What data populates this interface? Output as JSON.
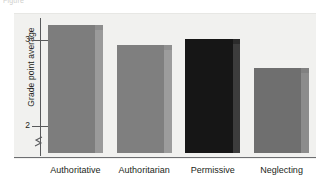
{
  "figure": {
    "clipped_caption": "Figure",
    "panel_background": "#f1f1ef",
    "axis_color": "#58595b",
    "axis_break_icon": "axis-break-zigzag"
  },
  "chart_data": {
    "type": "bar",
    "title": "",
    "subtitle": "",
    "xlabel": "",
    "ylabel": "Grade point average",
    "categories": [
      "Authoritative",
      "Authoritarian",
      "Permissive",
      "Neglecting"
    ],
    "values": [
      3.14,
      2.9,
      2.97,
      2.64
    ],
    "ylim": [
      1.65,
      3.25
    ],
    "yticks": [
      2,
      3
    ],
    "ytick_labels": [
      "2",
      "3"
    ],
    "y_axis_broken": true,
    "grid": false,
    "legend": "none",
    "annotations": [],
    "series": [
      {
        "name": "Grade point average",
        "values": [
          3.14,
          2.9,
          2.97,
          2.64
        ]
      }
    ],
    "bar_colors": [
      "#7d7d7d",
      "#7f7f7f",
      "#161616",
      "#6f6f6f"
    ],
    "bar_side_colors": [
      "#9a9a9a",
      "#9c9c9c",
      "#3c3c3c",
      "#8c8c8c"
    ],
    "bar_top_colors": [
      "#8e8e8e",
      "#909090",
      "#2b2b2b",
      "#818181"
    ]
  }
}
